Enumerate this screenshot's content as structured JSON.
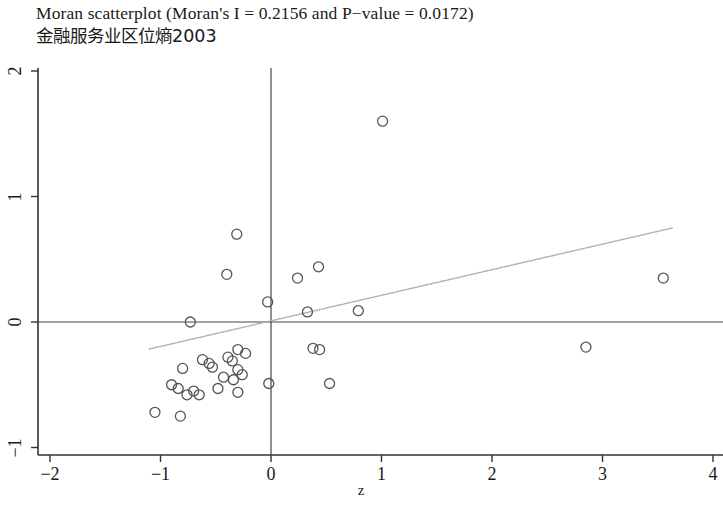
{
  "title": {
    "line1": "Moran scatterplot (Moran's I = 0.2156 and P−value = 0.0172)",
    "line2": "金融服务业区位熵2003"
  },
  "axis_labels": {
    "x": "z",
    "y": ""
  },
  "chart_data": {
    "type": "scatter",
    "title": "Moran scatterplot (Moran's I = 0.2156 and P−value = 0.0172)",
    "subtitle": "金融服务业区位熵2003",
    "xlabel": "z",
    "ylabel": "",
    "xlim": [
      -2.12,
      4.09
    ],
    "ylim": [
      -1.07,
      2.07
    ],
    "xticks": [
      -2,
      -1,
      0,
      1,
      2,
      3,
      4
    ],
    "yticks": [
      -1,
      0,
      1,
      2
    ],
    "grid": false,
    "legend": null,
    "moran_i": 0.2156,
    "p_value": 0.0172,
    "reference_lines": {
      "vertical_x": 0,
      "horizontal_y": 0
    },
    "fit_line": {
      "style": "dotted",
      "color": "#aaaaaa",
      "x_start": -1.1,
      "y_start": -0.215,
      "x_end": 3.63,
      "y_end": 0.749,
      "slope": 0.2156,
      "intercept": 0.022
    },
    "marker": {
      "shape": "circle-open",
      "color": "#555555",
      "radius_px": 5
    },
    "points": [
      {
        "x": 1.01,
        "y": 1.6
      },
      {
        "x": -0.31,
        "y": 0.7
      },
      {
        "x": -0.4,
        "y": 0.38
      },
      {
        "x": 0.43,
        "y": 0.44
      },
      {
        "x": 0.24,
        "y": 0.35
      },
      {
        "x": 3.55,
        "y": 0.35
      },
      {
        "x": -0.03,
        "y": 0.16
      },
      {
        "x": 0.33,
        "y": 0.08
      },
      {
        "x": 0.79,
        "y": 0.09
      },
      {
        "x": -0.73,
        "y": 0.0
      },
      {
        "x": 2.85,
        "y": -0.2
      },
      {
        "x": 0.38,
        "y": -0.21
      },
      {
        "x": 0.44,
        "y": -0.22
      },
      {
        "x": -0.3,
        "y": -0.22
      },
      {
        "x": -0.23,
        "y": -0.25
      },
      {
        "x": -0.39,
        "y": -0.28
      },
      {
        "x": -0.35,
        "y": -0.31
      },
      {
        "x": -0.62,
        "y": -0.3
      },
      {
        "x": -0.56,
        "y": -0.33
      },
      {
        "x": -0.53,
        "y": -0.36
      },
      {
        "x": -0.8,
        "y": -0.37
      },
      {
        "x": -0.3,
        "y": -0.38
      },
      {
        "x": -0.26,
        "y": -0.42
      },
      {
        "x": -0.43,
        "y": -0.44
      },
      {
        "x": -0.34,
        "y": -0.46
      },
      {
        "x": -0.02,
        "y": -0.49
      },
      {
        "x": 0.53,
        "y": -0.49
      },
      {
        "x": -0.9,
        "y": -0.5
      },
      {
        "x": -0.84,
        "y": -0.53
      },
      {
        "x": -0.7,
        "y": -0.55
      },
      {
        "x": -0.65,
        "y": -0.58
      },
      {
        "x": -0.76,
        "y": -0.58
      },
      {
        "x": -0.48,
        "y": -0.53
      },
      {
        "x": -0.3,
        "y": -0.56
      },
      {
        "x": -1.05,
        "y": -0.72
      },
      {
        "x": -0.82,
        "y": -0.75
      }
    ]
  },
  "ticks": {
    "x": [
      {
        "label": "−2",
        "value": -2
      },
      {
        "label": "−1",
        "value": -1
      },
      {
        "label": "0",
        "value": 0
      },
      {
        "label": "1",
        "value": 1
      },
      {
        "label": "2",
        "value": 2
      },
      {
        "label": "3",
        "value": 3
      },
      {
        "label": "4",
        "value": 4
      }
    ],
    "y": [
      {
        "label": "−1",
        "value": -1
      },
      {
        "label": "0",
        "value": 0
      },
      {
        "label": "1",
        "value": 1
      },
      {
        "label": "2",
        "value": 2
      }
    ]
  }
}
